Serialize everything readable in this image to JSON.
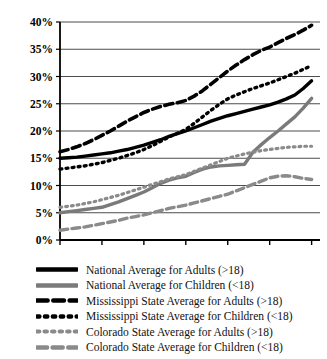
{
  "figure": {
    "title_fragment": "",
    "background": "#ffffff"
  },
  "chart_data": {
    "type": "line",
    "title": "",
    "subtitle": "",
    "xlabel": "",
    "ylabel": "",
    "xlim": [
      1980,
      2011
    ],
    "ylim": [
      0,
      40
    ],
    "grid": true,
    "grid_axis": "y",
    "legend_position": "below",
    "x_ticks": [
      "1980",
      "1985",
      "1990",
      "1995",
      "2000",
      "2005",
      "2010"
    ],
    "x_tick_values": [
      1980,
      1985,
      1990,
      1995,
      2000,
      2005,
      2010
    ],
    "y_ticks": [
      "0%",
      "5%",
      "10%",
      "15%",
      "20%",
      "25%",
      "30%",
      "35%",
      "40%"
    ],
    "y_tick_values": [
      0,
      5,
      10,
      15,
      20,
      25,
      30,
      35,
      40
    ],
    "x": [
      1980,
      1981,
      1982,
      1983,
      1984,
      1985,
      1986,
      1987,
      1988,
      1989,
      1990,
      1991,
      1992,
      1993,
      1994,
      1995,
      1996,
      1997,
      1998,
      1999,
      2000,
      2001,
      2002,
      2003,
      2004,
      2005,
      2006,
      2007,
      2008,
      2009,
      2010
    ],
    "series": [
      {
        "name": "National Average for Adults (>18)",
        "key": "national-adults",
        "color": "#000000",
        "style": "solid",
        "width": 3.4,
        "values": [
          15.0,
          15.1,
          15.2,
          15.4,
          15.6,
          15.8,
          16.0,
          16.3,
          16.6,
          17.0,
          17.4,
          17.9,
          18.4,
          19.0,
          19.5,
          20.0,
          20.6,
          21.2,
          21.8,
          22.3,
          22.8,
          23.2,
          23.6,
          24.0,
          24.4,
          24.8,
          25.3,
          25.9,
          26.6,
          27.8,
          29.2
        ]
      },
      {
        "name": "National Average for Children (<18)",
        "key": "national-children",
        "color": "#7a7a7a",
        "style": "solid",
        "width": 3.4,
        "values": [
          5.0,
          5.2,
          5.4,
          5.6,
          5.8,
          6.0,
          6.5,
          7.0,
          7.6,
          8.2,
          8.8,
          9.6,
          10.4,
          11.0,
          11.4,
          11.7,
          12.4,
          13.0,
          13.4,
          13.6,
          13.7,
          13.8,
          13.9,
          16.1,
          17.5,
          18.8,
          20.0,
          21.3,
          22.6,
          24.2,
          26.0
        ]
      },
      {
        "name": "Mississippi State Average for Adults (>18)",
        "key": "mississippi-adults",
        "color": "#000000",
        "style": "dashed",
        "width": 3.6,
        "values": [
          16.2,
          16.6,
          17.1,
          17.7,
          18.4,
          19.2,
          20.0,
          20.9,
          21.8,
          22.6,
          23.4,
          24.0,
          24.5,
          24.9,
          25.2,
          25.6,
          26.4,
          27.4,
          28.6,
          29.8,
          31.0,
          32.1,
          33.1,
          34.0,
          34.8,
          35.4,
          36.2,
          37.0,
          37.7,
          38.5,
          39.4
        ]
      },
      {
        "name": "Mississippi State Average for Children (<18)",
        "key": "mississippi-children",
        "color": "#000000",
        "style": "dotted",
        "width": 3.4,
        "values": [
          13.0,
          13.2,
          13.4,
          13.6,
          13.9,
          14.2,
          14.6,
          15.0,
          15.5,
          16.0,
          16.6,
          17.3,
          18.1,
          18.9,
          19.6,
          20.3,
          21.4,
          22.6,
          23.8,
          24.9,
          25.9,
          26.6,
          27.2,
          27.8,
          28.3,
          28.8,
          29.4,
          30.0,
          30.6,
          31.3,
          32.0
        ]
      },
      {
        "name": "Colorado State Average for Adults (>18)",
        "key": "colorado-adults",
        "color": "#8a8a8a",
        "style": "dotted",
        "width": 3.2,
        "values": [
          6.0,
          6.2,
          6.4,
          6.7,
          7.0,
          7.4,
          7.8,
          8.2,
          8.7,
          9.2,
          9.7,
          10.2,
          10.7,
          11.2,
          11.6,
          12.0,
          12.6,
          13.2,
          13.8,
          14.4,
          15.0,
          15.4,
          15.8,
          16.1,
          16.4,
          16.6,
          16.8,
          17.0,
          17.1,
          17.2,
          17.2
        ]
      },
      {
        "name": "Colorado State Average for Children (<18)",
        "key": "colorado-children",
        "color": "#8a8a8a",
        "style": "dashed",
        "width": 3.4,
        "values": [
          1.8,
          2.0,
          2.2,
          2.4,
          2.7,
          3.0,
          3.3,
          3.6,
          4.0,
          4.3,
          4.6,
          5.0,
          5.4,
          5.8,
          6.1,
          6.4,
          6.8,
          7.2,
          7.6,
          8.0,
          8.4,
          9.0,
          9.6,
          10.2,
          10.8,
          11.4,
          11.7,
          11.8,
          11.6,
          11.3,
          11.1
        ]
      }
    ]
  },
  "legend": {
    "items": [
      {
        "label": "National Average for Adults (>18)",
        "series_key": "national-adults"
      },
      {
        "label": "National Average for Children (<18)",
        "series_key": "national-children"
      },
      {
        "label": "Mississippi State Average for Adults (>18)",
        "series_key": "mississippi-adults"
      },
      {
        "label": "Mississippi State Average for Children (<18)",
        "series_key": "mississippi-children"
      },
      {
        "label": "Colorado State Average for Adults (>18)",
        "series_key": "colorado-adults"
      },
      {
        "label": "Colorado State Average for Children (<18)",
        "series_key": "colorado-children"
      }
    ]
  }
}
